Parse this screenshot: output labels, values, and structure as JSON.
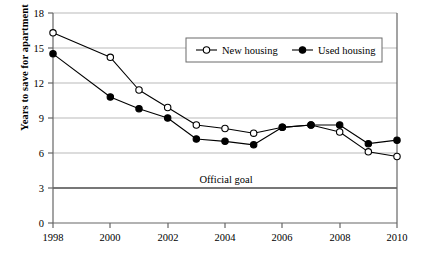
{
  "chart_data": {
    "type": "line",
    "title": "",
    "xlabel": "",
    "ylabel": "Years to save for apartment",
    "x": [
      1998,
      2000,
      2001,
      2002,
      2003,
      2004,
      2005,
      2006,
      2007,
      2008,
      2009,
      2010
    ],
    "xlim": [
      1998,
      2010
    ],
    "ylim": [
      0,
      18
    ],
    "ytick_labels": [
      "0",
      "3",
      "6",
      "9",
      "12",
      "15",
      "18"
    ],
    "yticks": [
      0,
      3,
      6,
      9,
      12,
      15,
      18
    ],
    "xtick_labels": [
      "1998",
      "2000",
      "2002",
      "2004",
      "2006",
      "2008",
      "2010"
    ],
    "xticks": [
      1998,
      2000,
      2002,
      2004,
      2006,
      2008,
      2010
    ],
    "grid": "horizontal",
    "legend_position": "top-center",
    "series": [
      {
        "name": "New housing",
        "marker": "open-circle",
        "color": "#000000",
        "values": [
          16.3,
          14.2,
          11.4,
          9.9,
          8.4,
          8.1,
          7.7,
          8.2,
          8.4,
          7.8,
          6.1,
          5.7
        ]
      },
      {
        "name": "Used housing",
        "marker": "filled-circle",
        "color": "#000000",
        "values": [
          14.5,
          10.8,
          9.8,
          9.0,
          7.2,
          7.0,
          6.7,
          8.2,
          8.4,
          8.4,
          6.8,
          7.1
        ]
      }
    ],
    "annotations": [
      {
        "text": "Official goal",
        "y_value": 3,
        "kind": "threshold-line"
      }
    ]
  },
  "legend": {
    "entries": [
      {
        "label": "New housing",
        "marker": "open-circle"
      },
      {
        "label": "Used housing",
        "marker": "filled-circle"
      }
    ]
  },
  "axes": {
    "y_title": "Years to save for apartment"
  },
  "annotation": {
    "official_goal_label": "Official goal"
  },
  "colors": {
    "ink": "#000000",
    "gridline": "#b9b9b9",
    "axis": "#555555",
    "goal_line": "#4a4a4a",
    "background": "#ffffff"
  }
}
